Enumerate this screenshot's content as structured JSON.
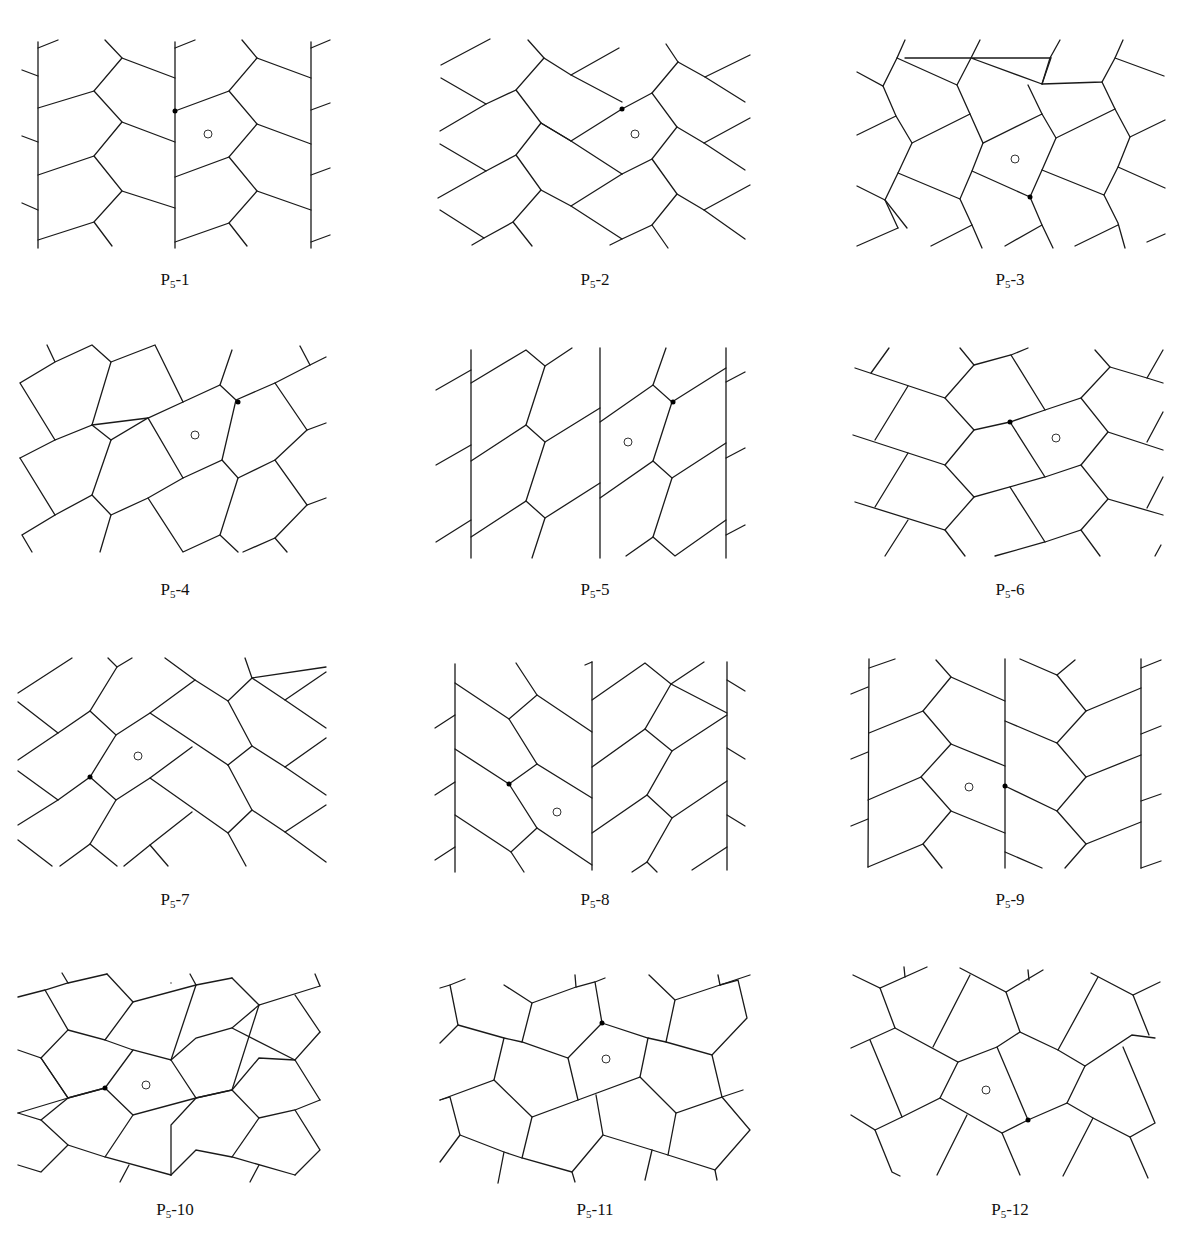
{
  "figure": {
    "legend": {
      "open_circle": "tile center marker",
      "filled_dot": "marked vertex"
    },
    "panels": [
      {
        "id": "P5-1",
        "prefix": "P",
        "sub": "5",
        "suffix": "-1"
      },
      {
        "id": "P5-2",
        "prefix": "P",
        "sub": "5",
        "suffix": "-2"
      },
      {
        "id": "P5-3",
        "prefix": "P",
        "sub": "5",
        "suffix": "-3"
      },
      {
        "id": "P5-4",
        "prefix": "P",
        "sub": "5",
        "suffix": "-4"
      },
      {
        "id": "P5-5",
        "prefix": "P",
        "sub": "5",
        "suffix": "-5"
      },
      {
        "id": "P5-6",
        "prefix": "P",
        "sub": "5",
        "suffix": "-6"
      },
      {
        "id": "P5-7",
        "prefix": "P",
        "sub": "5",
        "suffix": "-7"
      },
      {
        "id": "P5-8",
        "prefix": "P",
        "sub": "5",
        "suffix": "-8"
      },
      {
        "id": "P5-9",
        "prefix": "P",
        "sub": "5",
        "suffix": "-9"
      },
      {
        "id": "P5-10",
        "prefix": "P",
        "sub": "5",
        "suffix": "-10"
      },
      {
        "id": "P5-11",
        "prefix": "P",
        "sub": "5",
        "suffix": "-11"
      },
      {
        "id": "P5-12",
        "prefix": "P",
        "sub": "5",
        "suffix": "-12"
      }
    ]
  }
}
